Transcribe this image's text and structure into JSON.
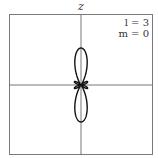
{
  "diagram": {
    "axis_label": "z",
    "params": {
      "l_label": "l = 3",
      "m_label": "m = 0"
    },
    "colors": {
      "frame": "#777777",
      "axes": "#666666",
      "curve": "#111111"
    }
  }
}
